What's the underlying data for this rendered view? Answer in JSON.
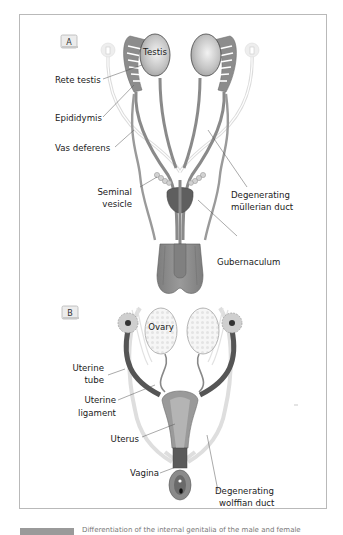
{
  "figure": {
    "panels": [
      {
        "tag": "A",
        "labels": {
          "testis": "Testis",
          "rete_testis": "Rete testis",
          "epididymis": "Epididymis",
          "vas_deferens": "Vas deferens",
          "seminal_vesicle_line1": "Seminal",
          "seminal_vesicle_line2": "vesicle",
          "mullerian_line1": "Degenerating",
          "mullerian_line2": "müllerian duct",
          "gubernaculum": "Gubernaculum"
        }
      },
      {
        "tag": "B",
        "labels": {
          "ovary": "Ovary",
          "uterine_tube_line1": "Uterine",
          "uterine_tube_line2": "tube",
          "uterine_ligament_line1": "Uterine",
          "uterine_ligament_line2": "ligament",
          "uterus": "Uterus",
          "vagina": "Vagina",
          "wolffian_line1": "Degenerating",
          "wolffian_line2": "wolffian duct"
        }
      }
    ],
    "caption": {
      "text": "Differentiation of the internal genitalia of the male and female"
    },
    "colors": {
      "duct": "#8a8a8a",
      "duct_dark": "#5e5e5e",
      "gonad": "#c8c8c8",
      "faint_duct": "#dedede",
      "label_text": "#1a1a1a",
      "frame_border": "#b9b9b9"
    }
  }
}
